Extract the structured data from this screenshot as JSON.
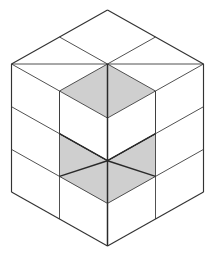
{
  "figure": {
    "background_color": "#ffffff",
    "line_color": "#3d3d3d",
    "shaded_face_color": "#cfcfcf",
    "white_face_color": "#ffffff",
    "projection": "isometric",
    "grid_columns": 2,
    "grid_rows": 2,
    "grid_levels": 3,
    "unit_half_width": 48,
    "unit_half_height": 27,
    "unit_height": 42.7,
    "origin_x": 107.5,
    "origin_y": 10,
    "shaded_region_count": 3,
    "shaded_regions": [
      {
        "name": "top-center-rhombus",
        "location": "top face, front cell",
        "color": "#cfcfcf"
      },
      {
        "name": "left-notch-triangle",
        "location": "left front, middle level",
        "color": "#cfcfcf"
      },
      {
        "name": "right-notch-triangle",
        "location": "right front, middle level",
        "color": "#cfcfcf"
      }
    ]
  }
}
